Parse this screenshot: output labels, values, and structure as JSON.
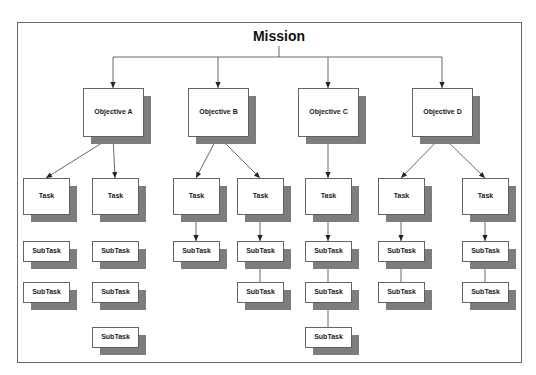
{
  "diagram": {
    "title": "Mission",
    "colors": {
      "shadow": "#7d7d7d",
      "box_fill": "#ffffff",
      "border": "#555555",
      "line": "#444444"
    },
    "objectives": [
      {
        "label": "Objective A",
        "tasks": [
          {
            "label": "Task",
            "subtasks_connected": false,
            "subtasks": [
              "SubTask",
              "SubTask"
            ]
          },
          {
            "label": "Task",
            "subtasks_connected": false,
            "subtasks": [
              "SubTask",
              "SubTask",
              "SubTask"
            ]
          }
        ]
      },
      {
        "label": "Objective B",
        "tasks": [
          {
            "label": "Task",
            "subtasks_connected": true,
            "subtasks": [
              "SubTask"
            ]
          },
          {
            "label": "Task",
            "subtasks_connected": true,
            "subtasks": [
              "SubTask",
              "SubTask"
            ]
          }
        ]
      },
      {
        "label": "Objective C",
        "tasks": [
          {
            "label": "Task",
            "subtasks_connected": true,
            "subtasks": [
              "SubTask",
              "SubTask",
              "SubTask"
            ]
          }
        ]
      },
      {
        "label": "Objective D",
        "tasks": [
          {
            "label": "Task",
            "subtasks_connected": true,
            "subtasks": [
              "SubTask",
              "SubTask"
            ]
          },
          {
            "label": "Task",
            "subtasks_connected": true,
            "subtasks": [
              "SubTask",
              "SubTask"
            ]
          }
        ]
      }
    ]
  }
}
